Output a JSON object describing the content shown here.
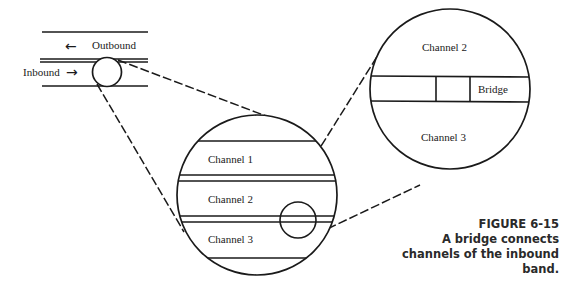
{
  "band": {
    "outbound_label": "Outbound",
    "inbound_label": "Inbound",
    "outbound_arrow": "←",
    "inbound_arrow": "→"
  },
  "middle_view": {
    "channels": [
      "Channel 1",
      "Channel 2",
      "Channel 3"
    ]
  },
  "detail_view": {
    "upper_channel": "Channel 2",
    "lower_channel": "Channel 3",
    "bridge_label": "Bridge"
  },
  "caption": {
    "figure_number": "FIGURE 6-15",
    "line1": "A bridge connects",
    "line2": "channels of the inbound",
    "line3": "band."
  },
  "colors": {
    "ink": "#1a1a1a",
    "background": "#ffffff"
  }
}
